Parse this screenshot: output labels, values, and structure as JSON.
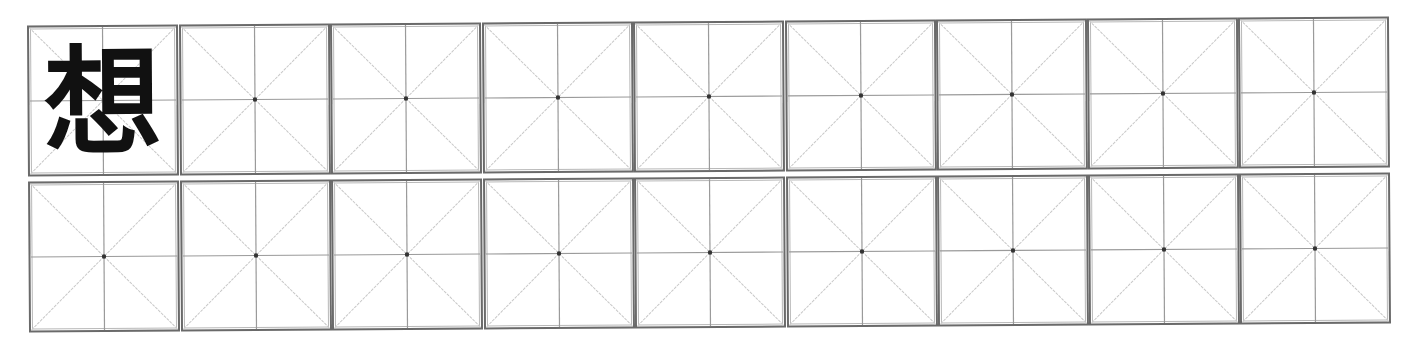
{
  "worksheet": {
    "type": "mi-zi-ge practice grid",
    "rows": 2,
    "columns": 9,
    "practice_character": "想",
    "colors": {
      "border": "#6a6a6a",
      "guide_line": "#9a9a9a",
      "diagonal_line": "#c8c8c8",
      "center_dot": "#333333",
      "character": "#111111"
    },
    "cells": [
      [
        {
          "char": "想",
          "center_dot": false
        },
        {
          "char": "",
          "center_dot": true
        },
        {
          "char": "",
          "center_dot": true
        },
        {
          "char": "",
          "center_dot": true
        },
        {
          "char": "",
          "center_dot": true
        },
        {
          "char": "",
          "center_dot": true
        },
        {
          "char": "",
          "center_dot": true
        },
        {
          "char": "",
          "center_dot": true
        },
        {
          "char": "",
          "center_dot": true
        }
      ],
      [
        {
          "char": "",
          "center_dot": true
        },
        {
          "char": "",
          "center_dot": true
        },
        {
          "char": "",
          "center_dot": true
        },
        {
          "char": "",
          "center_dot": true
        },
        {
          "char": "",
          "center_dot": true
        },
        {
          "char": "",
          "center_dot": true
        },
        {
          "char": "",
          "center_dot": true
        },
        {
          "char": "",
          "center_dot": true
        },
        {
          "char": "",
          "center_dot": true
        }
      ]
    ]
  }
}
